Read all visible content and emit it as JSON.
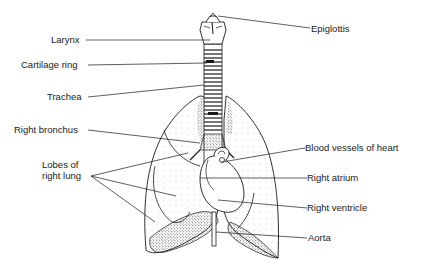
{
  "diagram": {
    "colors": {
      "ink": "#1a1a1a",
      "background": "#ffffff",
      "stipple": "#555555"
    },
    "labels": {
      "epiglottis": "Epiglottis",
      "larynx": "Larynx",
      "cartilage_ring": "Cartilage ring",
      "trachea": "Trachea",
      "right_bronchus": "Right bronchus",
      "lobes_line1": "Lobes of",
      "lobes_line2": "right lung",
      "blood_vessels": "Blood vessels of heart",
      "right_atrium": "Right atrium",
      "right_ventricle": "Right ventricle",
      "aorta": "Aorta"
    }
  }
}
